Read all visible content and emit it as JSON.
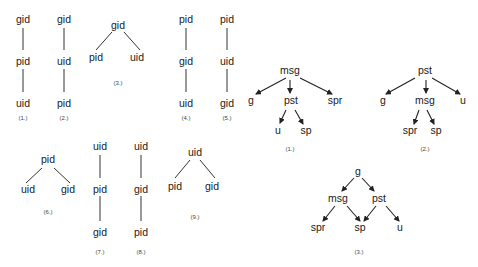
{
  "undirected_trees": [
    {
      "label": "(1.)",
      "type": "chain",
      "nodes": [
        "gid",
        "pid",
        "uid"
      ]
    },
    {
      "label": "(2.)",
      "type": "chain",
      "nodes": [
        "gid",
        "uid",
        "pid"
      ]
    },
    {
      "label": "(3.)",
      "type": "fork",
      "root": "gid",
      "children": [
        "pid",
        "uid"
      ]
    },
    {
      "label": "(4.)",
      "type": "chain",
      "nodes": [
        "pid",
        "gid",
        "uid"
      ]
    },
    {
      "label": "(5.)",
      "type": "chain",
      "nodes": [
        "pid",
        "uid",
        "gid"
      ]
    },
    {
      "label": "(6.)",
      "type": "fork",
      "root": "pid",
      "children": [
        "uid",
        "gid"
      ]
    },
    {
      "label": "(7.)",
      "type": "chain",
      "nodes": [
        "uid",
        "pid",
        "gid"
      ]
    },
    {
      "label": "(8.)",
      "type": "chain",
      "nodes": [
        "uid",
        "gid",
        "pid"
      ]
    },
    {
      "label": "(9.)",
      "type": "fork",
      "root": "uid",
      "children": [
        "pid",
        "gid"
      ]
    }
  ],
  "directed_graphs": [
    {
      "label": "(1.)",
      "nodes": {
        "a": "msg",
        "b": "g",
        "c": "pst",
        "d": "spr",
        "e": "u",
        "f": "sp"
      }
    },
    {
      "label": "(2.)",
      "nodes": {
        "a": "pst",
        "b": "g",
        "c": "msg",
        "d": "u",
        "e": "spr",
        "f": "sp"
      }
    },
    {
      "label": "(3.)",
      "nodes": {
        "a": "g",
        "b": "msg",
        "c": "pst",
        "d": "spr",
        "e": "sp",
        "f": "u"
      }
    }
  ]
}
